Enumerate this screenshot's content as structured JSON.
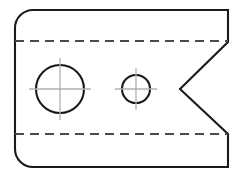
{
  "drawing": {
    "title": "Orthographic part view with V-notch and two through holes",
    "view_label": "front-view",
    "canvas": {
      "width": 244,
      "height": 179
    },
    "colors": {
      "background": "#ffffff",
      "visible_edge": "#1a1a1a",
      "hidden_edge": "#4a4a4a",
      "center_line": "#b0b0b0"
    },
    "body": {
      "name": "part-outline",
      "left_x": 15,
      "right_x": 228,
      "top_y": 10,
      "bottom_y": 167,
      "corner_radius": 18,
      "rounded_corners": [
        "top-left",
        "bottom-left"
      ],
      "sharp_corners": [
        "top-right",
        "bottom-right"
      ],
      "path": "M 33 10 L 228 10 L 228 42 L 180 89 L 228 134 L 228 167 L 33 167 A 18 18 0 0 1 15 149 L 15 28 A 18 18 0 0 1 33 10 Z"
    },
    "notch": {
      "name": "v-notch",
      "top_x": 228,
      "top_y": 42,
      "apex_x": 180,
      "apex_y": 89,
      "bottom_x": 228,
      "bottom_y": 134
    },
    "hidden_lines": [
      {
        "name": "hidden-line-upper",
        "x1": 15,
        "y1": 41,
        "x2": 228,
        "y2": 41
      },
      {
        "name": "hidden-line-lower",
        "x1": 15,
        "y1": 134,
        "x2": 228,
        "y2": 134
      }
    ],
    "holes": [
      {
        "name": "large-hole",
        "cx": 60,
        "cy": 89,
        "r": 24,
        "center_mark_h": {
          "x1": 29,
          "y1": 89,
          "x2": 91,
          "y2": 89
        },
        "center_mark_v": {
          "x1": 60,
          "y1": 58,
          "x2": 60,
          "y2": 120
        }
      },
      {
        "name": "small-hole",
        "cx": 136,
        "cy": 89,
        "r": 14,
        "center_mark_h": {
          "x1": 115,
          "y1": 89,
          "x2": 157,
          "y2": 89
        },
        "center_mark_v": {
          "x1": 136,
          "y1": 68,
          "x2": 136,
          "y2": 110
        }
      }
    ]
  }
}
